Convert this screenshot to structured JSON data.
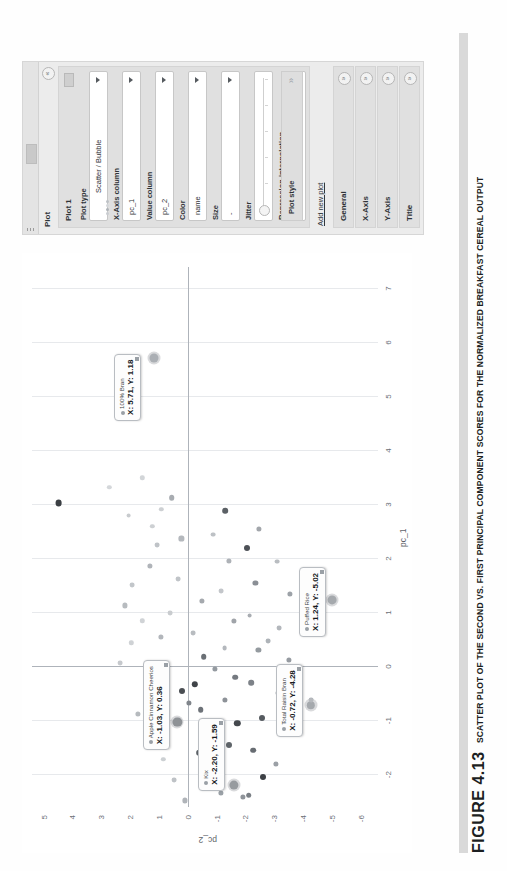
{
  "figure": {
    "number": "FIGURE 4.13",
    "caption": "SCATTER PLOT OF THE SECOND VS. FIRST PRINCIPAL COMPONENT SCORES FOR THE NORMALIZED BREAKFAST CEREAL OUTPUT"
  },
  "panel": {
    "title": "Plot",
    "collapse_icon": "«",
    "plot_card_title": "Plot 1",
    "menu_icon": "menu-icon",
    "fields": [
      {
        "label": "Plot type",
        "value": "Scatter / Bubble",
        "type": "select"
      },
      {
        "label": "X-Axis column",
        "value": "pc_1",
        "type": "select"
      },
      {
        "label": "Value column",
        "value": "pc_2",
        "type": "select"
      },
      {
        "label": "Color",
        "value": "name",
        "type": "select"
      },
      {
        "label": "Size",
        "value": "-",
        "type": "select"
      },
      {
        "label": "Jitter",
        "value": "",
        "type": "slider"
      },
      {
        "label": "Regression interpolation",
        "value": "None",
        "type": "select"
      }
    ],
    "plot_style_label": "Plot style",
    "plot_style_chevron": "»",
    "add_new_plot": "Add new plot",
    "sections": [
      {
        "label": "General",
        "expand_icon": "»"
      },
      {
        "label": "X-Axis",
        "expand_icon": "»"
      },
      {
        "label": "Y-Axis",
        "expand_icon": "»"
      },
      {
        "label": "Title",
        "expand_icon": "»"
      }
    ]
  },
  "chart_data": {
    "type": "scatter",
    "title": "",
    "xlabel": "pc_1",
    "ylabel": "pc_2",
    "xlim": [
      -2.6,
      7.4
    ],
    "ylim": [
      -6.6,
      5.4
    ],
    "xticks": [
      -2,
      -1,
      0,
      1,
      2,
      3,
      4,
      5,
      6,
      7
    ],
    "yticks": [
      5,
      4,
      3,
      2,
      1,
      0,
      -1,
      -2,
      -3,
      -4,
      -5,
      -6
    ],
    "grid": true,
    "legend": false,
    "annotations": [
      {
        "name": "100% Bran",
        "x": 5.71,
        "y": 1.18,
        "label_x": 4.55,
        "label_y": 2.55
      },
      {
        "name": "Total Raisin Bran",
        "x": -0.72,
        "y": -4.28,
        "label_x": -1.3,
        "label_y": -3.05
      },
      {
        "name": "Apple Cinnamon Cheerios",
        "x": -1.03,
        "y": 0.36,
        "label_x": -1.55,
        "label_y": 1.55
      },
      {
        "name": "Kix",
        "x": -2.2,
        "y": -1.59,
        "label_x": -2.3,
        "label_y": -0.35
      },
      {
        "name": "Puffed Rice",
        "x": 1.24,
        "y": -5.02,
        "label_x": 0.55,
        "label_y": -3.85
      }
    ],
    "points": [
      {
        "x": 5.71,
        "y": 1.18,
        "r": 4.5,
        "c": "#9aa0a6"
      },
      {
        "x": 3.03,
        "y": 4.48,
        "r": 3.4,
        "c": "#3b3f44"
      },
      {
        "x": -0.72,
        "y": -4.28,
        "r": 4.2,
        "c": "#8d9298"
      },
      {
        "x": -1.03,
        "y": 0.36,
        "r": 4.6,
        "c": "#5a5f65"
      },
      {
        "x": -2.2,
        "y": -1.59,
        "r": 4.6,
        "c": "#6e7379"
      },
      {
        "x": 1.24,
        "y": -5.02,
        "r": 4.4,
        "c": "#8d9298"
      },
      {
        "x": 1.13,
        "y": 2.19,
        "r": 2.6,
        "c": "#b7bbbf"
      },
      {
        "x": 1.52,
        "y": 1.92,
        "r": 2.4,
        "c": "#c2c6ca"
      },
      {
        "x": 0.44,
        "y": 1.95,
        "r": 2.2,
        "c": "#cfd2d5"
      },
      {
        "x": 0.07,
        "y": 2.35,
        "r": 2.4,
        "c": "#c6c9cd"
      },
      {
        "x": 1.86,
        "y": 1.32,
        "r": 2.6,
        "c": "#b0b4b9"
      },
      {
        "x": 2.26,
        "y": 1.05,
        "r": 2.4,
        "c": "#bfc3c7"
      },
      {
        "x": 2.6,
        "y": 1.23,
        "r": 2.2,
        "c": "#cdd0d3"
      },
      {
        "x": 3.13,
        "y": 0.55,
        "r": 2.8,
        "c": "#a8acb1"
      },
      {
        "x": 2.37,
        "y": 0.22,
        "r": 2.6,
        "c": "#b4b8bd"
      },
      {
        "x": 1.62,
        "y": 0.34,
        "r": 2.4,
        "c": "#c0c4c8"
      },
      {
        "x": 1.0,
        "y": 0.62,
        "r": 2.4,
        "c": "#c9cccf"
      },
      {
        "x": 0.55,
        "y": 0.92,
        "r": 2.6,
        "c": "#b2b6bb"
      },
      {
        "x": -0.1,
        "y": 0.75,
        "r": 2.4,
        "c": "#bcc0c4"
      },
      {
        "x": -0.45,
        "y": 0.2,
        "r": 3.0,
        "c": "#4a4e53"
      },
      {
        "x": -0.33,
        "y": -0.25,
        "r": 3.2,
        "c": "#3f4348"
      },
      {
        "x": -0.8,
        "y": -0.45,
        "r": 2.8,
        "c": "#6d7278"
      },
      {
        "x": -1.25,
        "y": -0.75,
        "r": 2.6,
        "c": "#878c91"
      },
      {
        "x": -1.6,
        "y": -0.4,
        "r": 2.8,
        "c": "#5c6166"
      },
      {
        "x": -1.9,
        "y": -0.98,
        "r": 3.0,
        "c": "#494d52"
      },
      {
        "x": -2.15,
        "y": -0.62,
        "r": 2.8,
        "c": "#70757b"
      },
      {
        "x": -2.35,
        "y": -1.15,
        "r": 2.6,
        "c": "#9aa0a6"
      },
      {
        "x": -1.45,
        "y": -1.42,
        "r": 3.0,
        "c": "#5f6469"
      },
      {
        "x": -1.05,
        "y": -1.72,
        "r": 3.2,
        "c": "#44484d"
      },
      {
        "x": -0.62,
        "y": -1.3,
        "r": 2.6,
        "c": "#8d9298"
      },
      {
        "x": -0.2,
        "y": -1.65,
        "r": 2.8,
        "c": "#757a80"
      },
      {
        "x": 0.35,
        "y": -1.28,
        "r": 2.4,
        "c": "#b4b8bd"
      },
      {
        "x": 0.85,
        "y": -1.6,
        "r": 2.6,
        "c": "#a0a4a9"
      },
      {
        "x": 1.4,
        "y": -1.15,
        "r": 2.4,
        "c": "#c3c6ca"
      },
      {
        "x": 1.95,
        "y": -1.42,
        "r": 2.6,
        "c": "#aeb2b7"
      },
      {
        "x": 2.45,
        "y": -0.88,
        "r": 2.4,
        "c": "#bdc1c5"
      },
      {
        "x": 2.88,
        "y": -1.3,
        "r": 2.8,
        "c": "#5b6065"
      },
      {
        "x": 2.2,
        "y": -2.05,
        "r": 3.0,
        "c": "#4d5157"
      },
      {
        "x": 1.55,
        "y": -2.35,
        "r": 2.6,
        "c": "#8a8f95"
      },
      {
        "x": 0.95,
        "y": -2.15,
        "r": 2.4,
        "c": "#a9adb2"
      },
      {
        "x": 0.3,
        "y": -2.45,
        "r": 2.6,
        "c": "#949a9f"
      },
      {
        "x": -0.3,
        "y": -2.2,
        "r": 2.8,
        "c": "#7d8288"
      },
      {
        "x": -0.95,
        "y": -2.58,
        "r": 3.0,
        "c": "#565b60"
      },
      {
        "x": -1.55,
        "y": -2.28,
        "r": 2.8,
        "c": "#676c72"
      },
      {
        "x": -2.05,
        "y": -2.62,
        "r": 3.0,
        "c": "#3c4045"
      },
      {
        "x": -2.38,
        "y": -2.12,
        "r": 2.8,
        "c": "#7a7f85"
      },
      {
        "x": -1.8,
        "y": -3.05,
        "r": 2.6,
        "c": "#9ba0a6"
      },
      {
        "x": -1.18,
        "y": -3.35,
        "r": 2.6,
        "c": "#888d93"
      },
      {
        "x": -0.48,
        "y": -3.12,
        "r": 2.4,
        "c": "#a6abb0"
      },
      {
        "x": 0.12,
        "y": -3.5,
        "r": 2.6,
        "c": "#969ba1"
      },
      {
        "x": 0.72,
        "y": -3.18,
        "r": 2.4,
        "c": "#b3b7bc"
      },
      {
        "x": 1.35,
        "y": -3.55,
        "r": 2.6,
        "c": "#9da2a8"
      },
      {
        "x": 1.95,
        "y": -3.1,
        "r": 2.4,
        "c": "#b9bdc1"
      },
      {
        "x": 2.55,
        "y": -2.48,
        "r": 2.6,
        "c": "#a2a6ab"
      },
      {
        "x": -1.35,
        "y": 1.38,
        "r": 2.4,
        "c": "#c7cacd"
      },
      {
        "x": -0.88,
        "y": 1.72,
        "r": 2.6,
        "c": "#b6babe"
      },
      {
        "x": -0.25,
        "y": 1.45,
        "r": 2.4,
        "c": "#c2c5c9"
      },
      {
        "x": 0.85,
        "y": 1.58,
        "r": 2.2,
        "c": "#d0d3d6"
      },
      {
        "x": 2.8,
        "y": 2.05,
        "r": 2.4,
        "c": "#c8cbce"
      },
      {
        "x": 3.5,
        "y": 1.58,
        "r": 2.2,
        "c": "#d2d5d8"
      },
      {
        "x": -2.48,
        "y": 0.1,
        "r": 2.6,
        "c": "#b0b4b9"
      },
      {
        "x": -2.1,
        "y": 0.48,
        "r": 2.4,
        "c": "#bec2c6"
      },
      {
        "x": -1.72,
        "y": 0.85,
        "r": 2.2,
        "c": "#ccd0d3"
      },
      {
        "x": -0.68,
        "y": -0.05,
        "r": 2.6,
        "c": "#80858b"
      },
      {
        "x": 0.18,
        "y": -0.55,
        "r": 2.8,
        "c": "#6a6f75"
      },
      {
        "x": 0.62,
        "y": -0.18,
        "r": 2.4,
        "c": "#b8bcc0"
      },
      {
        "x": 1.22,
        "y": -0.48,
        "r": 2.6,
        "c": "#a5a9ae"
      },
      {
        "x": -2.42,
        "y": -1.92,
        "r": 2.6,
        "c": "#8f949a"
      },
      {
        "x": -1.28,
        "y": -1.05,
        "r": 2.4,
        "c": "#aab0b5"
      },
      {
        "x": -0.05,
        "y": -0.95,
        "r": 2.6,
        "c": "#949aa0"
      },
      {
        "x": 0.48,
        "y": -2.78,
        "r": 2.4,
        "c": "#aeb3b8"
      },
      {
        "x": -0.62,
        "y": -4.28,
        "r": 2.4,
        "c": "#b2b6bb"
      },
      {
        "x": 1.05,
        "y": -4.45,
        "r": 2.2,
        "c": "#c0c4c8"
      },
      {
        "x": 2.92,
        "y": 0.92,
        "r": 2.2,
        "c": "#cdd0d3"
      },
      {
        "x": 3.32,
        "y": 2.72,
        "r": 2.2,
        "c": "#d4d7da"
      }
    ]
  }
}
